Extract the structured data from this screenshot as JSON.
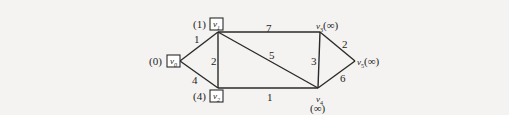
{
  "graph": {
    "nodes": [
      {
        "id": "v0",
        "name": "v",
        "sub": "0",
        "distance_label": "(0)",
        "boxed": true
      },
      {
        "id": "v1",
        "name": "v",
        "sub": "1",
        "distance_label": "(1)",
        "boxed": true
      },
      {
        "id": "v2",
        "name": "v",
        "sub": "2",
        "distance_label": "(4)",
        "boxed": true
      },
      {
        "id": "v3",
        "name": "v",
        "sub": "3",
        "distance_label": "(∞)",
        "boxed": false
      },
      {
        "id": "v4",
        "name": "v",
        "sub": "4",
        "distance_label": "(∞)",
        "boxed": false
      },
      {
        "id": "v5",
        "name": "v",
        "sub": "5",
        "distance_label": "(∞)",
        "boxed": false
      }
    ],
    "edges": [
      {
        "from": "v0",
        "to": "v1",
        "weight": "1"
      },
      {
        "from": "v0",
        "to": "v2",
        "weight": "4"
      },
      {
        "from": "v1",
        "to": "v2",
        "weight": "2"
      },
      {
        "from": "v1",
        "to": "v3",
        "weight": "7"
      },
      {
        "from": "v1",
        "to": "v4",
        "weight": "5"
      },
      {
        "from": "v2",
        "to": "v4",
        "weight": "1"
      },
      {
        "from": "v3",
        "to": "v4",
        "weight": "3"
      },
      {
        "from": "v3",
        "to": "v5",
        "weight": "2"
      },
      {
        "from": "v4",
        "to": "v5",
        "weight": "6"
      }
    ]
  }
}
